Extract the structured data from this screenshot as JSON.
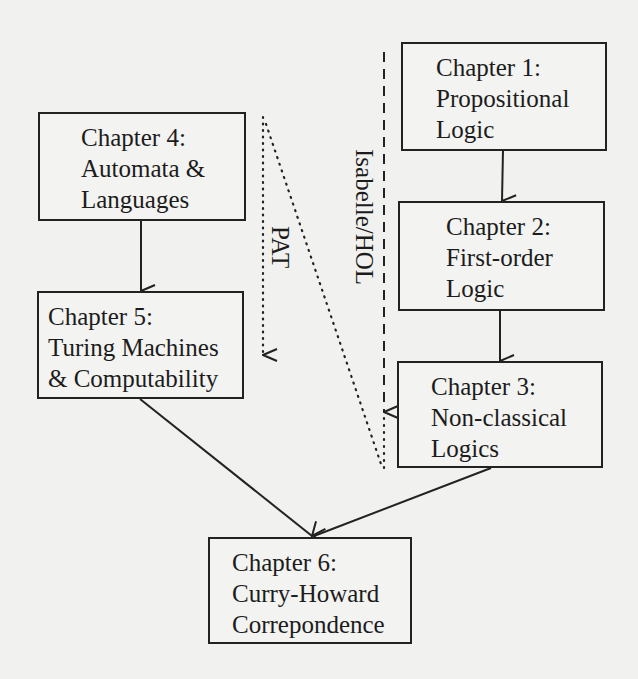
{
  "diagram": {
    "nodes": [
      {
        "id": "ch1",
        "line1": "Chapter 1:",
        "line2": "Propositional",
        "line3": "Logic"
      },
      {
        "id": "ch2",
        "line1": "Chapter 2:",
        "line2": "First-order",
        "line3": "Logic"
      },
      {
        "id": "ch3",
        "line1": "Chapter 3:",
        "line2": "Non-classical",
        "line3": "Logics"
      },
      {
        "id": "ch4",
        "line1": "Chapter 4:",
        "line2": "Automata &",
        "line3": "Languages"
      },
      {
        "id": "ch5",
        "line1": "Chapter 5:",
        "line2": "Turing Machines",
        "line3": "& Computability"
      },
      {
        "id": "ch6",
        "line1": "Chapter 6:",
        "line2": "Curry-Howard",
        "line3": "Correpondence"
      }
    ],
    "edges": [
      {
        "from": "ch1",
        "to": "ch2",
        "style": "solid"
      },
      {
        "from": "ch2",
        "to": "ch3",
        "style": "solid"
      },
      {
        "from": "ch4",
        "to": "ch5",
        "style": "solid"
      },
      {
        "from": "ch5",
        "to": "ch6",
        "style": "solid"
      },
      {
        "from": "ch3",
        "to": "ch6",
        "style": "solid"
      }
    ],
    "annotations": {
      "isabelle_label": "Isabelle/HOL",
      "isabelle_style": "dashed",
      "pat_label": "PAT",
      "pat_style": "dotted"
    },
    "colors": {
      "line": "#222222",
      "background": "#f1f1ef"
    }
  }
}
